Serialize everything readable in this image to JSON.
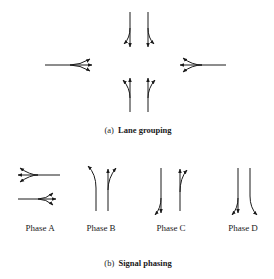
{
  "figure": {
    "part_a": {
      "caption_letter": "(a)",
      "caption_text": "Lane grouping",
      "approaches": [
        {
          "id": "north",
          "lanes": [
            "left+through",
            "through+right"
          ]
        },
        {
          "id": "west",
          "lanes": [
            "left+through+right"
          ]
        },
        {
          "id": "east",
          "lanes": [
            "left+through+right"
          ]
        },
        {
          "id": "south",
          "lanes": [
            "left+through",
            "through+right"
          ]
        }
      ]
    },
    "part_b": {
      "caption_letter": "(b)",
      "caption_text": "Signal phasing",
      "phases": [
        {
          "label": "Phase A",
          "movements": "east-west all movements"
        },
        {
          "label": "Phase B",
          "movements": "northbound left + through"
        },
        {
          "label": "Phase C",
          "movements": "southbound through+left, northbound through+right"
        },
        {
          "label": "Phase D",
          "movements": "southbound left + through, right"
        }
      ]
    },
    "stroke_color": "#1a1a1a",
    "background": "#ffffff"
  }
}
